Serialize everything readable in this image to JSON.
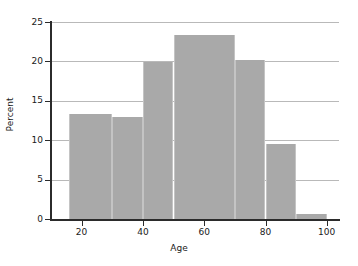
{
  "chart_data": {
    "type": "bar",
    "title": "",
    "subtitle": "",
    "xlabel": "Age",
    "ylabel": "Percent",
    "xlim": [
      10,
      104
    ],
    "ylim": [
      0,
      25
    ],
    "grid": true,
    "legend": false,
    "legend_position": "none",
    "orientation": "vertical",
    "bar_color": "#a9a9a9",
    "bar_edge_color": "#c4c4c4",
    "gridline_color": "#b9b9b9",
    "axis_color": "#2b2b2b",
    "background_color": "#ffffff",
    "xticks": [
      20,
      40,
      60,
      80,
      100
    ],
    "xtick_labels": [
      "20",
      "40",
      "60",
      "80",
      "100"
    ],
    "yticks": [
      0,
      5,
      10,
      15,
      20,
      25
    ],
    "ytick_labels": [
      "0",
      "5",
      "10",
      "15",
      "20",
      "25"
    ],
    "bins": [
      {
        "label": "16-30",
        "x_start": 16,
        "x_end": 30,
        "value": 13.3
      },
      {
        "label": "30-40",
        "x_start": 30,
        "x_end": 40,
        "value": 12.9
      },
      {
        "label": "40-50",
        "x_start": 40,
        "x_end": 50,
        "value": 19.9
      },
      {
        "label": "50-70",
        "x_start": 50,
        "x_end": 70,
        "value": 23.4
      },
      {
        "label": "70-80",
        "x_start": 70,
        "x_end": 80,
        "value": 20.2
      },
      {
        "label": "80-90",
        "x_start": 80,
        "x_end": 90,
        "value": 9.5
      },
      {
        "label": "90-100",
        "x_start": 90,
        "x_end": 100,
        "value": 0.6
      }
    ],
    "categories": [
      "16-30",
      "30-40",
      "40-50",
      "50-70",
      "70-80",
      "80-90",
      "90-100"
    ],
    "values": [
      13.3,
      12.9,
      19.9,
      23.4,
      20.2,
      9.5,
      0.6
    ]
  }
}
